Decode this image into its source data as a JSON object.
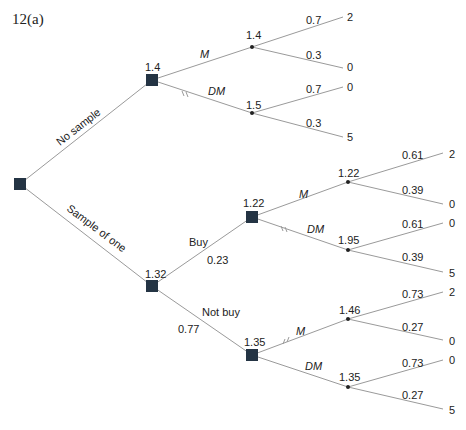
{
  "title": "12(a)",
  "colors": {
    "decision_node": "#243444",
    "chance_node": "#222222",
    "edge": "#9a9a9a",
    "text": "#222222"
  },
  "root": {
    "type": "decision"
  },
  "branches": {
    "no_sample": {
      "label": "No sample",
      "node_value": "1.4",
      "actions": {
        "m": {
          "label": "M",
          "chance_value": "1.4",
          "outcomes": [
            {
              "prob": "0.7",
              "payoff": "2"
            },
            {
              "prob": "0.3",
              "payoff": "0"
            }
          ]
        },
        "dm": {
          "label": "DM",
          "pruned": true,
          "chance_value": "1.5",
          "outcomes": [
            {
              "prob": "0.7",
              "payoff": "0"
            },
            {
              "prob": "0.3",
              "payoff": "5"
            }
          ]
        }
      }
    },
    "sample_of_one": {
      "label": "Sample of one",
      "node_value": "1.32",
      "results": {
        "buy": {
          "label": "Buy",
          "prob": "0.23",
          "node_value": "1.22",
          "actions": {
            "m": {
              "label": "M",
              "chance_value": "1.22",
              "outcomes": [
                {
                  "prob": "0.61",
                  "payoff": "2"
                },
                {
                  "prob": "0.39",
                  "payoff": "0"
                }
              ]
            },
            "dm": {
              "label": "DM",
              "pruned": true,
              "chance_value": "1.95",
              "outcomes": [
                {
                  "prob": "0.61",
                  "payoff": "0"
                },
                {
                  "prob": "0.39",
                  "payoff": "5"
                }
              ]
            }
          }
        },
        "not_buy": {
          "label": "Not buy",
          "prob": "0.77",
          "node_value": "1.35",
          "actions": {
            "m": {
              "label": "M",
              "pruned": true,
              "chance_value": "1.46",
              "outcomes": [
                {
                  "prob": "0.73",
                  "payoff": "2"
                },
                {
                  "prob": "0.27",
                  "payoff": "0"
                }
              ]
            },
            "dm": {
              "label": "DM",
              "chance_value": "1.35",
              "outcomes": [
                {
                  "prob": "0.73",
                  "payoff": "0"
                },
                {
                  "prob": "0.27",
                  "payoff": "5"
                }
              ]
            }
          }
        }
      }
    }
  }
}
